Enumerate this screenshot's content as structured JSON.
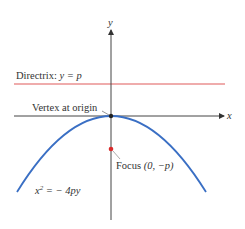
{
  "diagram": {
    "type": "parabola-opening-downward",
    "axes": {
      "x_label": "x",
      "y_label": "y"
    },
    "directrix": {
      "label_prefix": "Directrix: ",
      "label_eq": "y = p",
      "color": "#e05a5a"
    },
    "vertex": {
      "label": "Vertex at origin",
      "color": "#222222"
    },
    "focus": {
      "label_prefix": "Focus ",
      "label_coords": "(0, −p)",
      "color": "#d92b2b"
    },
    "curve": {
      "equation_lhs": "x",
      "equation_sup": "2",
      "equation_rhs": " = − 4py",
      "color": "#3a6fc4"
    }
  }
}
